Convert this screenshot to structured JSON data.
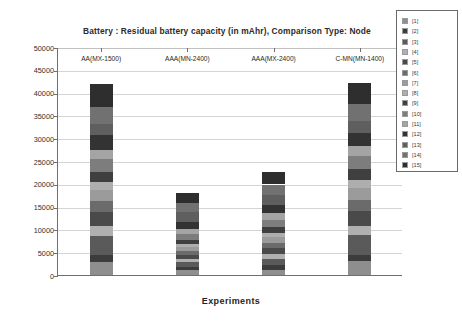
{
  "chart_data": {
    "type": "bar",
    "stacked": true,
    "title": "Battery :  Residual battery capacity  (in mAhr), Comparison Type: Node",
    "xlabel": "Experiments",
    "ylabel": "Metric Value",
    "ylim": [
      0,
      50000
    ],
    "ytick_step": 5000,
    "ytick_labels": [
      "50000",
      "45000",
      "40000",
      "35000",
      "30000",
      "25000",
      "20000",
      "15000",
      "10000",
      "5000",
      "0"
    ],
    "grid": true,
    "legend_position": "right",
    "categories": [
      "AA(MX-1500)",
      "AAA(MN-2400)",
      "AAA(MX-2400)",
      "C-MN(MN-1400)"
    ],
    "series": [
      {
        "name": "[1]",
        "color": "#8e8e8e",
        "values": [
          2900,
          1000,
          1200,
          3000
        ]
      },
      {
        "name": "[2]",
        "color": "#3c3c3c",
        "values": [
          1500,
          700,
          900,
          1400
        ]
      },
      {
        "name": "[3]",
        "color": "#5a5a5a",
        "values": [
          4200,
          1100,
          1500,
          4300
        ]
      },
      {
        "name": "[4]",
        "color": "#b0b0b0",
        "values": [
          2100,
          750,
          1000,
          2100
        ]
      },
      {
        "name": "[5]",
        "color": "#4a4a4a",
        "values": [
          3100,
          900,
          1250,
          3200
        ]
      },
      {
        "name": "[6]",
        "color": "#6b6b6b",
        "values": [
          2400,
          800,
          1100,
          2500
        ]
      },
      {
        "name": "[7]",
        "color": "#9b9b9b",
        "values": [
          2500,
          950,
          1350,
          2600
        ]
      },
      {
        "name": "[8]",
        "color": "#aeaeae",
        "values": [
          1700,
          700,
          1000,
          1800
        ]
      },
      {
        "name": "[9]",
        "color": "#3f3f3f",
        "values": [
          2300,
          850,
          1200,
          2300
        ]
      },
      {
        "name": "[10]",
        "color": "#7d7d7d",
        "values": [
          2700,
          1150,
          1500,
          2800
        ]
      },
      {
        "name": "[11]",
        "color": "#a4a4a4",
        "values": [
          2100,
          1300,
          1650,
          2200
        ]
      },
      {
        "name": "[12]",
        "color": "#333333",
        "values": [
          3100,
          1500,
          1800,
          3000
        ]
      },
      {
        "name": "[13]",
        "color": "#5f5f5f",
        "values": [
          2600,
          2200,
          2150,
          2500
        ]
      },
      {
        "name": "[14]",
        "color": "#717171",
        "values": [
          3600,
          1950,
          2250,
          3700
        ]
      },
      {
        "name": "[15]",
        "color": "#2e2e2e",
        "values": [
          5200,
          2150,
          2650,
          4800
        ]
      }
    ],
    "totals": [
      42000,
      18000,
      22500,
      42200
    ]
  },
  "legend": {
    "items": [
      "[1]",
      "[2]",
      "[3]",
      "[4]",
      "[5]",
      "[6]",
      "[7]",
      "[8]",
      "[9]",
      "[10]",
      "[11]",
      "[12]",
      "[13]",
      "[14]",
      "[15]"
    ]
  },
  "colors": {
    "axis": "#6f6f6f",
    "grid": "#d4d4d4",
    "text": "#2b2b2b",
    "plot_background": "#ffffff",
    "page_background": "#ffffff"
  }
}
